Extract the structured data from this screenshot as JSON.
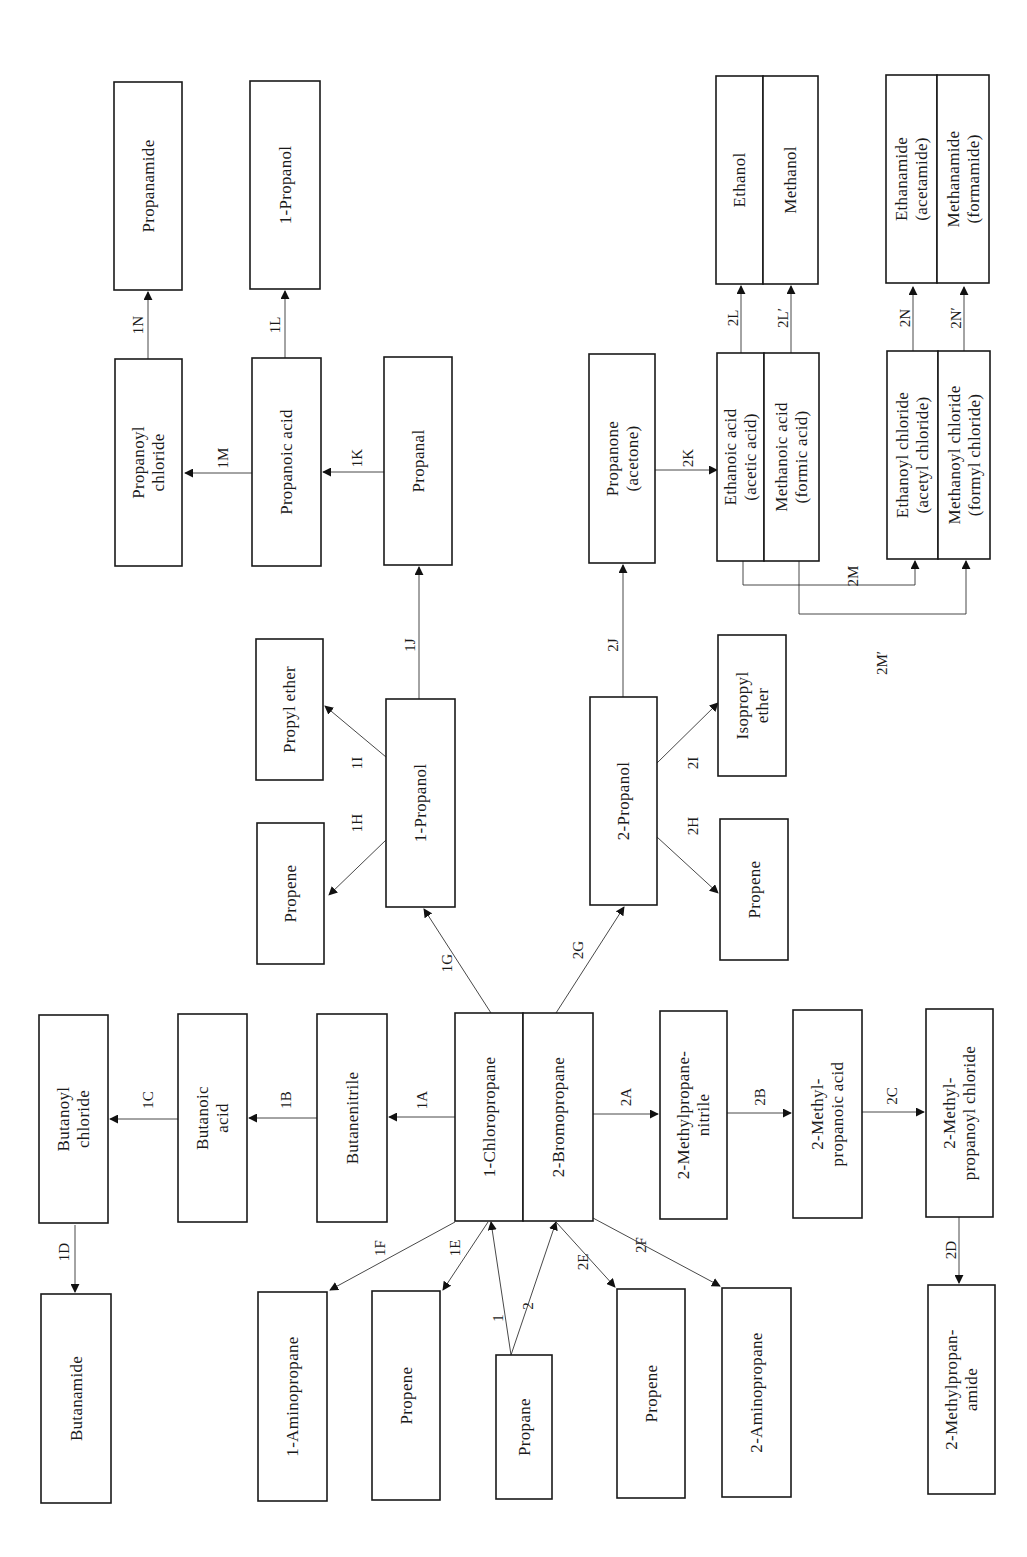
{
  "diagram": {
    "orientation": "rotated-90-ccw",
    "nodes": [
      {
        "id": "propanamide",
        "lines": [
          "Propanamide"
        ]
      },
      {
        "id": "propanol-1-top",
        "lines": [
          "1-Propanol"
        ]
      },
      {
        "id": "propanoyl-chloride",
        "lines": [
          "Propanoyl",
          "chloride"
        ]
      },
      {
        "id": "propanoic-acid",
        "lines": [
          "Propanoic acid"
        ]
      },
      {
        "id": "propanal",
        "lines": [
          "Propanal"
        ]
      },
      {
        "id": "propyl-ether",
        "lines": [
          "Propyl ether"
        ]
      },
      {
        "id": "propene-1h",
        "lines": [
          "Propene"
        ]
      },
      {
        "id": "propanol-1",
        "lines": [
          "1-Propanol"
        ]
      },
      {
        "id": "propanone",
        "lines": [
          "Propanone",
          "(acetone)"
        ]
      },
      {
        "id": "propanol-2",
        "lines": [
          "2-Propanol"
        ]
      },
      {
        "id": "isopropyl-ether",
        "lines": [
          "Isopropyl",
          "ether"
        ]
      },
      {
        "id": "propene-2h",
        "lines": [
          "Propene"
        ]
      },
      {
        "id": "ethanoic-acid",
        "lines": [
          "Ethanoic acid",
          "(acetic acid)"
        ]
      },
      {
        "id": "methanoic-acid",
        "lines": [
          "Methanoic acid",
          "(formic acid)"
        ]
      },
      {
        "id": "ethanol",
        "lines": [
          "Ethanol"
        ]
      },
      {
        "id": "methanol",
        "lines": [
          "Methanol"
        ]
      },
      {
        "id": "ethanoyl-chloride",
        "lines": [
          "Ethanoyl chloride",
          "(acetyl chloride)"
        ]
      },
      {
        "id": "methanoyl-chloride",
        "lines": [
          "Methanoyl chloride",
          "(formyl chloride)"
        ]
      },
      {
        "id": "ethanamide",
        "lines": [
          "Ethanamide",
          "(acetamide)"
        ]
      },
      {
        "id": "methanamide",
        "lines": [
          "Methanamide",
          "(formamide)"
        ]
      },
      {
        "id": "butanoyl-chloride",
        "lines": [
          "Butanoyl",
          "chloride"
        ]
      },
      {
        "id": "butanoic-acid",
        "lines": [
          "Butanoic",
          "acid"
        ]
      },
      {
        "id": "butanenitrile",
        "lines": [
          "Butanenitrile"
        ]
      },
      {
        "id": "chloropropane-1",
        "lines": [
          "1-Chloropropane"
        ]
      },
      {
        "id": "bromopropane-2",
        "lines": [
          "2-Bromopropane"
        ]
      },
      {
        "id": "methylpropanenitrile",
        "lines": [
          "2-Methylpropane-",
          "nitrile"
        ]
      },
      {
        "id": "methylpropanoic-acid",
        "lines": [
          "2-Methyl-",
          "propanoic acid"
        ]
      },
      {
        "id": "methylpropanoyl-chloride",
        "lines": [
          "2-Methyl-",
          "propanoyl chloride"
        ]
      },
      {
        "id": "butanamide",
        "lines": [
          "Butanamide"
        ]
      },
      {
        "id": "aminopropane-1",
        "lines": [
          "1-Aminopropane"
        ]
      },
      {
        "id": "propene-1e",
        "lines": [
          "Propene"
        ]
      },
      {
        "id": "propane",
        "lines": [
          "Propane"
        ]
      },
      {
        "id": "propene-2e",
        "lines": [
          "Propene"
        ]
      },
      {
        "id": "aminopropane-2",
        "lines": [
          "2-Aminopropane"
        ]
      },
      {
        "id": "methylpropanamide",
        "lines": [
          "2-Methylpropan-",
          "amide"
        ]
      }
    ],
    "edges": [
      {
        "label": "1",
        "from": "propane",
        "to": "chloropropane-1"
      },
      {
        "label": "2",
        "from": "propane",
        "to": "bromopropane-2"
      },
      {
        "label": "1A",
        "from": "chloropropane-1",
        "to": "butanenitrile"
      },
      {
        "label": "1B",
        "from": "butanenitrile",
        "to": "butanoic-acid"
      },
      {
        "label": "1C",
        "from": "butanoic-acid",
        "to": "butanoyl-chloride"
      },
      {
        "label": "1D",
        "from": "butanoyl-chloride",
        "to": "butanamide"
      },
      {
        "label": "1E",
        "from": "chloropropane-1",
        "to": "propene-1e"
      },
      {
        "label": "1F",
        "from": "chloropropane-1",
        "to": "aminopropane-1"
      },
      {
        "label": "1G",
        "from": "chloropropane-1",
        "to": "propanol-1"
      },
      {
        "label": "1H",
        "from": "propanol-1",
        "to": "propene-1h"
      },
      {
        "label": "1I",
        "from": "propanol-1",
        "to": "propyl-ether"
      },
      {
        "label": "1J",
        "from": "propanol-1",
        "to": "propanal"
      },
      {
        "label": "1K",
        "from": "propanal",
        "to": "propanoic-acid"
      },
      {
        "label": "1L",
        "from": "propanoic-acid",
        "to": "propanol-1-top"
      },
      {
        "label": "1M",
        "from": "propanoic-acid",
        "to": "propanoyl-chloride"
      },
      {
        "label": "1N",
        "from": "propanoyl-chloride",
        "to": "propanamide"
      },
      {
        "label": "2A",
        "from": "bromopropane-2",
        "to": "methylpropanenitrile"
      },
      {
        "label": "2B",
        "from": "methylpropanenitrile",
        "to": "methylpropanoic-acid"
      },
      {
        "label": "2C",
        "from": "methylpropanoic-acid",
        "to": "methylpropanoyl-chloride"
      },
      {
        "label": "2D",
        "from": "methylpropanoyl-chloride",
        "to": "methylpropanamide"
      },
      {
        "label": "2E",
        "from": "bromopropane-2",
        "to": "propene-2e"
      },
      {
        "label": "2F",
        "from": "bromopropane-2",
        "to": "aminopropane-2"
      },
      {
        "label": "2G",
        "from": "bromopropane-2",
        "to": "propanol-2"
      },
      {
        "label": "2H",
        "from": "propanol-2",
        "to": "propene-2h"
      },
      {
        "label": "2I",
        "from": "propanol-2",
        "to": "isopropyl-ether"
      },
      {
        "label": "2J",
        "from": "propanol-2",
        "to": "propanone"
      },
      {
        "label": "2K",
        "from": "propanone",
        "to": "ethanoic-acid"
      },
      {
        "label": "2L",
        "from": "ethanoic-acid",
        "to": "ethanol"
      },
      {
        "label": "2L′",
        "from": "methanoic-acid",
        "to": "methanol"
      },
      {
        "label": "2M",
        "from": "ethanoic-acid",
        "to": "ethanoyl-chloride"
      },
      {
        "label": "2M′",
        "from": "methanoic-acid",
        "to": "methanoyl-chloride"
      },
      {
        "label": "2N",
        "from": "ethanoyl-chloride",
        "to": "ethanamide"
      },
      {
        "label": "2N′",
        "from": "methanoyl-chloride",
        "to": "methanamide"
      }
    ]
  }
}
